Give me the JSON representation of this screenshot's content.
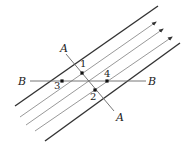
{
  "diagram": {
    "type": "field-lines-with-sections",
    "colors": {
      "boundary": "#333333",
      "field_line": "#999999",
      "section_line": "#666666",
      "point": "#111111",
      "text": "#222222"
    },
    "boundaries": [
      {
        "x1": 15,
        "y1": 106,
        "x2": 158,
        "y2": 6
      },
      {
        "x1": 45,
        "y1": 141,
        "x2": 180,
        "y2": 43
      }
    ],
    "field_lines": [
      {
        "x1": 20,
        "y1": 117,
        "x2": 156,
        "y2": 22
      },
      {
        "x1": 26,
        "y1": 125,
        "x2": 163,
        "y2": 29
      },
      {
        "x1": 35,
        "y1": 131,
        "x2": 172,
        "y2": 37
      }
    ],
    "section_A": {
      "x1": 66,
      "y1": 54,
      "x2": 114,
      "y2": 111,
      "label_start": "A",
      "label_end": "A"
    },
    "section_B": {
      "x1": 30,
      "y1": 81,
      "x2": 146,
      "y2": 81,
      "label_start": "B",
      "label_end": "B"
    },
    "points": [
      {
        "id": "1",
        "x": 82,
        "y": 73,
        "label_x": 80,
        "label_y": 67
      },
      {
        "id": "2",
        "x": 95,
        "y": 90,
        "label_x": 90,
        "label_y": 100
      },
      {
        "id": "3",
        "x": 62,
        "y": 81,
        "label_x": 54,
        "label_y": 89
      },
      {
        "id": "4",
        "x": 107,
        "y": 81,
        "label_x": 104,
        "label_y": 77
      }
    ],
    "labels": {
      "A_top": {
        "text": "A",
        "x": 60,
        "y": 52
      },
      "A_bottom": {
        "text": "A",
        "x": 116,
        "y": 121
      },
      "B_left": {
        "text": "B",
        "x": 18,
        "y": 85
      },
      "B_right": {
        "text": "B",
        "x": 148,
        "y": 85
      }
    }
  }
}
